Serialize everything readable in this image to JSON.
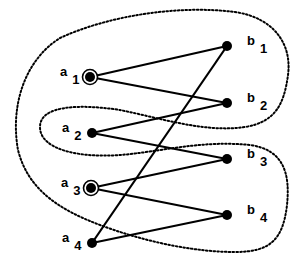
{
  "diagram": {
    "type": "bipartite-graph",
    "colors": {
      "stroke": "#000000",
      "background": "#ffffff"
    },
    "left_nodes": [
      {
        "id": "a1",
        "letter": "a",
        "sub": "1",
        "x": 90,
        "y": 77,
        "marked": true
      },
      {
        "id": "a2",
        "letter": "a",
        "sub": "2",
        "x": 92,
        "y": 133,
        "marked": false
      },
      {
        "id": "a3",
        "letter": "a",
        "sub": "3",
        "x": 91,
        "y": 188,
        "marked": true
      },
      {
        "id": "a4",
        "letter": "a",
        "sub": "4",
        "x": 92,
        "y": 243,
        "marked": false
      }
    ],
    "right_nodes": [
      {
        "id": "b1",
        "letter": "b",
        "sub": "1",
        "x": 227,
        "y": 46
      },
      {
        "id": "b2",
        "letter": "b",
        "sub": "2",
        "x": 227,
        "y": 103
      },
      {
        "id": "b3",
        "letter": "b",
        "sub": "3",
        "x": 227,
        "y": 159
      },
      {
        "id": "b4",
        "letter": "b",
        "sub": "4",
        "x": 227,
        "y": 215
      }
    ],
    "edges": [
      [
        "a1",
        "b1"
      ],
      [
        "a1",
        "b2"
      ],
      [
        "a2",
        "b2"
      ],
      [
        "a2",
        "b3"
      ],
      [
        "a3",
        "b3"
      ],
      [
        "a3",
        "b4"
      ],
      [
        "a4",
        "b4"
      ],
      [
        "a4",
        "b1"
      ]
    ],
    "region": {
      "style": "dotted",
      "description": "closed dotted boundary enclosing a1, a3, b1, b2, b3, b4 and excluding a2, a4"
    }
  }
}
